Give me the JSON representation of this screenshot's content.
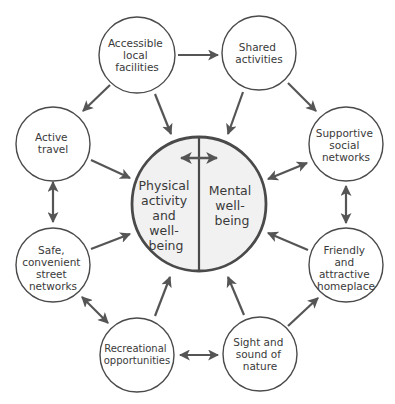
{
  "colors": {
    "stroke": "#4a4a4a",
    "arrow": "#555555",
    "center_fill": "#f1f1f1",
    "node_fill": "#ffffff",
    "text": "#3a3a3a"
  },
  "center": {
    "left_label": [
      "Physical",
      "activity",
      "and",
      "well-",
      "being"
    ],
    "right_label": [
      "Mental",
      "well-",
      "being"
    ]
  },
  "nodes": [
    {
      "id": "accessible",
      "lines": [
        "Accessible",
        "local",
        "facilities"
      ]
    },
    {
      "id": "shared",
      "lines": [
        "Shared",
        "activities"
      ]
    },
    {
      "id": "active",
      "lines": [
        "Active",
        "travel"
      ]
    },
    {
      "id": "supportive",
      "lines": [
        "Supportive",
        "social",
        "networks"
      ]
    },
    {
      "id": "safe",
      "lines": [
        "Safe,",
        "convenient",
        "street",
        "networks"
      ]
    },
    {
      "id": "friendly",
      "lines": [
        "Friendly",
        "and",
        "attractive",
        "homeplace"
      ]
    },
    {
      "id": "recreational",
      "lines": [
        "Recreational",
        "opportunities"
      ]
    },
    {
      "id": "sight",
      "lines": [
        "Sight and",
        "sound of",
        "nature"
      ]
    }
  ],
  "edges": [
    {
      "from": "accessible",
      "to": "shared",
      "type": "one-way"
    },
    {
      "from": "accessible",
      "to": "active",
      "type": "one-way"
    },
    {
      "from": "accessible",
      "to": "center",
      "type": "one-way"
    },
    {
      "from": "shared",
      "to": "center",
      "type": "one-way"
    },
    {
      "from": "shared",
      "to": "supportive",
      "type": "one-way"
    },
    {
      "from": "active",
      "to": "center",
      "type": "one-way"
    },
    {
      "from": "active",
      "to": "safe",
      "type": "two-way"
    },
    {
      "from": "supportive",
      "to": "center",
      "type": "two-way"
    },
    {
      "from": "supportive",
      "to": "friendly",
      "type": "two-way"
    },
    {
      "from": "safe",
      "to": "center",
      "type": "one-way"
    },
    {
      "from": "safe",
      "to": "recreational",
      "type": "two-way"
    },
    {
      "from": "friendly",
      "to": "center",
      "type": "one-way"
    },
    {
      "from": "recreational",
      "to": "center",
      "type": "one-way"
    },
    {
      "from": "recreational",
      "to": "sight",
      "type": "two-way"
    },
    {
      "from": "sight",
      "to": "center",
      "type": "one-way"
    },
    {
      "from": "sight",
      "to": "friendly",
      "type": "one-way"
    },
    {
      "from": "physical",
      "to": "mental",
      "type": "two-way"
    }
  ]
}
